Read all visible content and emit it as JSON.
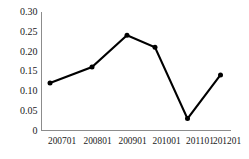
{
  "chart_data": {
    "type": "line",
    "title": "",
    "subtitle": "",
    "xlabel": "",
    "ylabel": "",
    "categories": [
      "200701",
      "200801",
      "200901",
      "201001",
      "201101",
      "201201"
    ],
    "values": [
      0.12,
      0.16,
      0.24,
      0.21,
      0.03,
      0.14
    ],
    "series": [
      {
        "name": "",
        "values": [
          0.12,
          0.16,
          0.24,
          0.21,
          0.03,
          0.14
        ]
      }
    ],
    "ylim": [
      0,
      0.3
    ],
    "yticks": [
      0,
      0.05,
      0.1,
      0.15,
      0.2,
      0.25,
      0.3
    ],
    "ytick_labels": [
      "0",
      "0.05",
      "0.10",
      "0.15",
      "0.20",
      "0.25",
      "0.30"
    ],
    "xtick_labels": [
      "200701",
      "200801",
      "200901",
      "201001",
      "201101",
      "201201"
    ],
    "grid": false,
    "legend": false,
    "legend_position": "none",
    "marker": "circle",
    "line_color": "#000000",
    "marker_color": "#000000",
    "axis_color": "#8c8c8c",
    "background_color": "#ffffff"
  },
  "axes": {
    "y_axis_name": "y-axis",
    "x_axis_name": "x-axis"
  }
}
